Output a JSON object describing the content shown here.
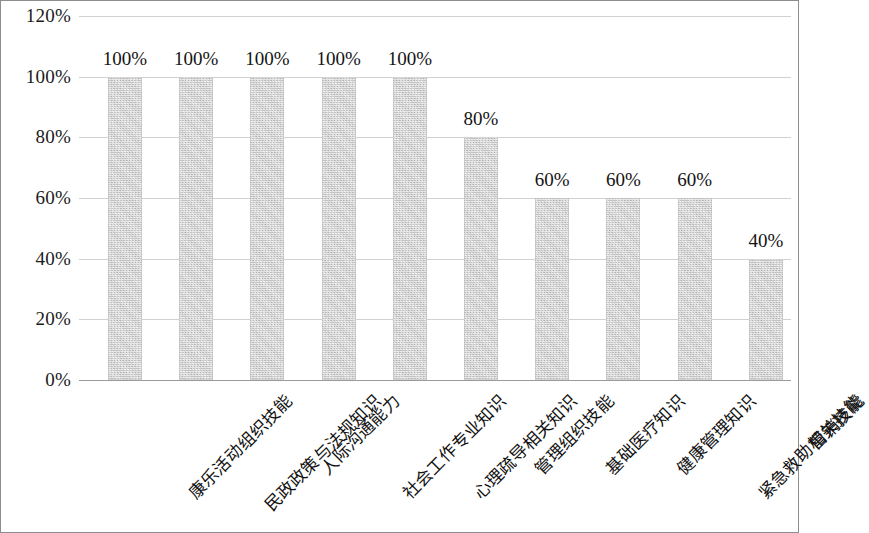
{
  "chart_data": {
    "type": "bar",
    "title": "",
    "subtitle": "",
    "xlabel": "",
    "ylabel": "",
    "ylim": [
      0,
      120
    ],
    "y_tick_labels": [
      "0%",
      "20%",
      "40%",
      "60%",
      "80%",
      "100%",
      "120%"
    ],
    "y_tick_values": [
      0,
      20,
      40,
      60,
      80,
      100,
      120
    ],
    "grid": true,
    "legend": false,
    "legend_position": "none",
    "bar_color": "#d2d2d2",
    "categories": [
      "康乐活动组织技能",
      "民政政策与法规知识",
      "人际沟通能力",
      "社会工作专业知识",
      "心理疏导相关知识",
      "管理组织技能",
      "基础医疗知识",
      "健康管理知识",
      "紧急救助相关技能",
      "营销技能"
    ],
    "values": [
      100,
      100,
      100,
      100,
      100,
      80,
      60,
      60,
      60,
      40
    ],
    "data_labels": [
      "100%",
      "100%",
      "100%",
      "100%",
      "100%",
      "80%",
      "60%",
      "60%",
      "60%",
      "40%"
    ]
  }
}
